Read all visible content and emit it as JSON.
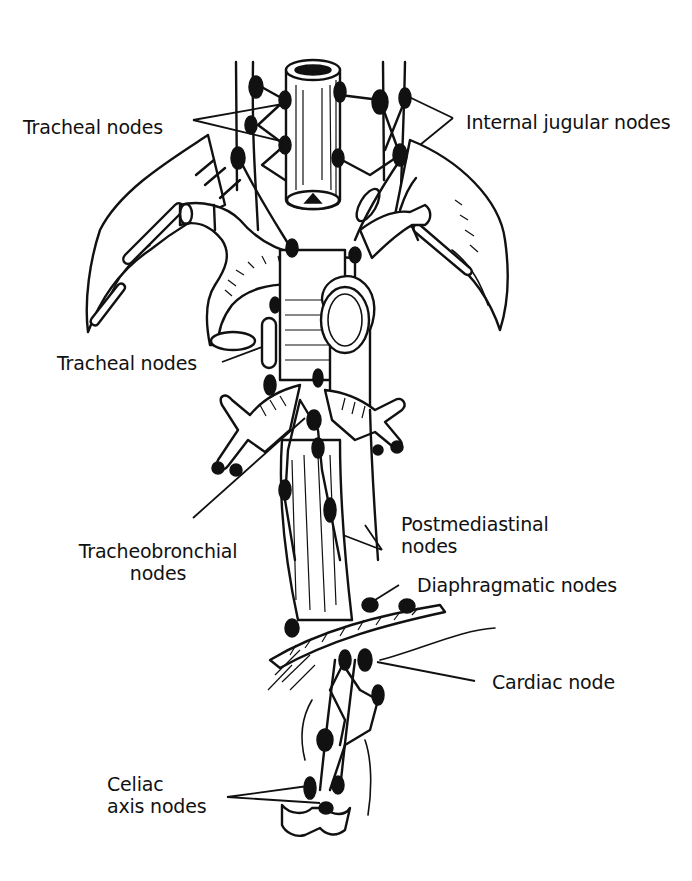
{
  "figure": {
    "background": "#ffffff",
    "ink_color": "#111111",
    "labels": [
      {
        "id": "tracheal-nodes-upper",
        "text": "Tracheal nodes",
        "lines": [
          "Tracheal nodes"
        ],
        "x": 23,
        "y": 116
      },
      {
        "id": "internal-jugular-nodes",
        "text": "Internal jugular nodes",
        "lines": [
          "Internal jugular nodes"
        ],
        "x": 466,
        "y": 111
      },
      {
        "id": "tracheal-nodes-lower",
        "text": "Tracheal nodes",
        "lines": [
          "Tracheal nodes"
        ],
        "x": 57,
        "y": 352
      },
      {
        "id": "tracheobronchial-nodes",
        "text": "Tracheobronchial nodes",
        "lines": [
          "Tracheobronchial",
          "nodes"
        ],
        "x": 73,
        "y": 540
      },
      {
        "id": "postmediastinal-nodes",
        "text": "Postmediastinal nodes",
        "lines": [
          "Postmediastinal",
          "nodes"
        ],
        "x": 401,
        "y": 513
      },
      {
        "id": "diaphragmatic-nodes",
        "text": "Diaphragmatic nodes",
        "lines": [
          "Diaphragmatic nodes"
        ],
        "x": 417,
        "y": 574
      },
      {
        "id": "cardiac-node",
        "text": "Cardiac node",
        "lines": [
          "Cardiac node"
        ],
        "x": 492,
        "y": 671
      },
      {
        "id": "celiac-axis-nodes",
        "text": "Celiac axis nodes",
        "lines": [
          "Celiac",
          "axis nodes"
        ],
        "x": 107,
        "y": 773
      }
    ],
    "structures": [
      "trachea",
      "esophagus",
      "aortic arch",
      "subclavian veins",
      "bronchi",
      "diaphragm",
      "stomach cardia",
      "celiac axis"
    ]
  }
}
